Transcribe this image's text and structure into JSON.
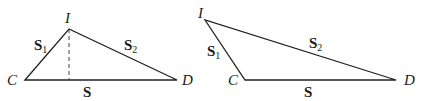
{
  "figure": {
    "colors": {
      "line": "#222222",
      "text": "#1a1a1a",
      "background": "#ffffff"
    },
    "triangles": [
      {
        "id": "left",
        "vertices": {
          "I": {
            "label": "I",
            "x": 69,
            "y": 29
          },
          "C": {
            "label": "C",
            "x": 25,
            "y": 80
          },
          "D": {
            "label": "D",
            "x": 177,
            "y": 80
          }
        },
        "altitude": {
          "style": "dashed",
          "from": "I",
          "foot_x": 69,
          "foot_y": 80
        },
        "sides": {
          "s1": {
            "label": "S",
            "sub": "1",
            "between": "C-I"
          },
          "s2": {
            "label": "S",
            "sub": "2",
            "between": "I-D"
          },
          "s": {
            "label": "S",
            "between": "C-D"
          }
        }
      },
      {
        "id": "right",
        "vertices": {
          "I": {
            "label": "I",
            "x": 205,
            "y": 20
          },
          "C": {
            "label": "C",
            "x": 245,
            "y": 80
          },
          "D": {
            "label": "D",
            "x": 396,
            "y": 80
          }
        },
        "sides": {
          "s1": {
            "label": "S",
            "sub": "1",
            "between": "I-C"
          },
          "s2": {
            "label": "S",
            "sub": "2",
            "between": "I-D"
          },
          "s": {
            "label": "S",
            "between": "C-D"
          }
        }
      }
    ]
  }
}
